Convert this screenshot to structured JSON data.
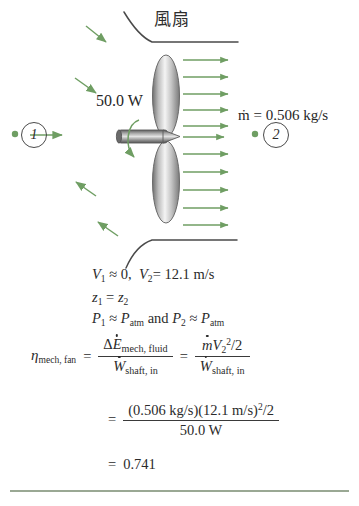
{
  "figure": {
    "title_label": "風扇",
    "power_label": "50.0 W",
    "mass_flow_label": "ṁ = 0.506 kg/s",
    "state_1": "1",
    "state_2": "2",
    "colors": {
      "arrow_green": "#6f9e63",
      "duct_outline": "#4a4a4a",
      "blade_gray": "#9a9a9a",
      "rule_green": "#9aa894",
      "text": "#2b2b2b"
    },
    "icons": {
      "inlet_arrows": "inflow-arrow-icon",
      "outlet_arrows": "outflow-arrow-icon",
      "rotation": "shaft-rotation-arrow-icon",
      "fan": "fan-blade-icon",
      "shaft": "motor-shaft-icon"
    }
  },
  "equations": {
    "line_velocity": {
      "v1_sym": "V",
      "v1_sub": "1",
      "approx": "≈",
      "v1_val": "0,",
      "v2_sym": "V",
      "v2_sub": "2",
      "eq": "=",
      "v2_val": "12.1 m/s"
    },
    "line_elevation": {
      "z1_sym": "z",
      "z1_sub": "1",
      "eq": "=",
      "z2_sym": "z",
      "z2_sub": "2"
    },
    "line_pressure": {
      "p1_sym": "P",
      "p1_sub": "1",
      "approx1": "≈",
      "patm1_sym": "P",
      "patm1_sub": "atm",
      "conj": "and",
      "p2_sym": "P",
      "p2_sub": "2",
      "approx2": "≈",
      "patm2_sym": "P",
      "patm2_sub": "atm"
    },
    "line_efficiency": {
      "eta_sym": "η",
      "eta_sub": "mech, fan",
      "eq1": "=",
      "num1_delta": "Δ",
      "num1_e": "E",
      "num1_sub": "mech, fluid",
      "den1_w": "W",
      "den1_sub": "shaft, in",
      "eq2": "=",
      "num2_m": "m",
      "num2_v": "V",
      "num2_vsub": "2",
      "num2_vsup": "2",
      "num2_tail": "/2",
      "den2_w": "W",
      "den2_sub": "shaft, in"
    },
    "line_numeric": {
      "eq": "=",
      "numerator": "(0.506 kg/s)(12.1 m/s)",
      "numerator_sup": "2",
      "numerator_tail": "/2",
      "denominator": "50.0 W"
    },
    "line_result": {
      "eq": "=",
      "value": "0.741"
    }
  }
}
